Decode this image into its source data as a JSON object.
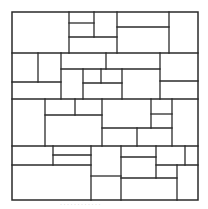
{
  "diagram": {
    "stroke_color": "#2a2a2a",
    "background": "#ffffff",
    "outer": {
      "x": 12,
      "y": 12,
      "width": 186,
      "height": 188
    },
    "bands": [
      {
        "name": "band-1",
        "y_top": 12,
        "y_bottom": 53
      },
      {
        "name": "band-2",
        "y_top": 53,
        "y_bottom": 99
      },
      {
        "name": "band-3",
        "y_top": 99,
        "y_bottom": 146
      },
      {
        "name": "band-4",
        "y_top": 146,
        "y_bottom": 200
      }
    ],
    "segments": [
      {
        "id": "h-band1-bottom",
        "x1": 12,
        "y1": 53,
        "x2": 198,
        "y2": 53
      },
      {
        "id": "h-band2-bottom",
        "x1": 12,
        "y1": 99,
        "x2": 198,
        "y2": 99
      },
      {
        "id": "h-band3-bottom",
        "x1": 12,
        "y1": 146,
        "x2": 198,
        "y2": 146
      },
      {
        "id": "b1-v69",
        "x1": 69,
        "y1": 12,
        "x2": 69,
        "y2": 53
      },
      {
        "id": "b1-h23",
        "x1": 69,
        "y1": 23,
        "x2": 94,
        "y2": 23
      },
      {
        "id": "b1-v94",
        "x1": 94,
        "y1": 12,
        "x2": 94,
        "y2": 37
      },
      {
        "id": "b1-h37",
        "x1": 69,
        "y1": 37,
        "x2": 117,
        "y2": 37
      },
      {
        "id": "b1-v117",
        "x1": 117,
        "y1": 12,
        "x2": 117,
        "y2": 53
      },
      {
        "id": "b1-h27",
        "x1": 117,
        "y1": 27,
        "x2": 169,
        "y2": 27
      },
      {
        "id": "b1-v169",
        "x1": 169,
        "y1": 12,
        "x2": 169,
        "y2": 53
      },
      {
        "id": "b2-v38",
        "x1": 38,
        "y1": 53,
        "x2": 38,
        "y2": 82
      },
      {
        "id": "b2-h82",
        "x1": 12,
        "y1": 82,
        "x2": 61,
        "y2": 82
      },
      {
        "id": "b2-v61",
        "x1": 61,
        "y1": 53,
        "x2": 61,
        "y2": 99
      },
      {
        "id": "b2-h69",
        "x1": 61,
        "y1": 69,
        "x2": 160,
        "y2": 69
      },
      {
        "id": "b2-v106",
        "x1": 106,
        "y1": 53,
        "x2": 106,
        "y2": 69
      },
      {
        "id": "b2-v83",
        "x1": 83,
        "y1": 69,
        "x2": 83,
        "y2": 99
      },
      {
        "id": "b2-v101",
        "x1": 101,
        "y1": 69,
        "x2": 101,
        "y2": 83
      },
      {
        "id": "b2-h83",
        "x1": 83,
        "y1": 83,
        "x2": 122,
        "y2": 83
      },
      {
        "id": "b2-v122",
        "x1": 122,
        "y1": 69,
        "x2": 122,
        "y2": 99
      },
      {
        "id": "b2-v160",
        "x1": 160,
        "y1": 53,
        "x2": 160,
        "y2": 99
      },
      {
        "id": "b2-h81",
        "x1": 160,
        "y1": 81,
        "x2": 198,
        "y2": 81
      },
      {
        "id": "b3-v45",
        "x1": 45,
        "y1": 99,
        "x2": 45,
        "y2": 146
      },
      {
        "id": "b3-v75",
        "x1": 75,
        "y1": 99,
        "x2": 75,
        "y2": 115
      },
      {
        "id": "b3-h115",
        "x1": 45,
        "y1": 115,
        "x2": 102,
        "y2": 115
      },
      {
        "id": "b3-v102",
        "x1": 102,
        "y1": 99,
        "x2": 102,
        "y2": 146
      },
      {
        "id": "b3-h128",
        "x1": 102,
        "y1": 128,
        "x2": 172,
        "y2": 128
      },
      {
        "id": "b3-v151",
        "x1": 151,
        "y1": 99,
        "x2": 151,
        "y2": 128
      },
      {
        "id": "b3-h114",
        "x1": 151,
        "y1": 114,
        "x2": 172,
        "y2": 114
      },
      {
        "id": "b3-v137",
        "x1": 137,
        "y1": 128,
        "x2": 137,
        "y2": 146
      },
      {
        "id": "b3-v172",
        "x1": 172,
        "y1": 99,
        "x2": 172,
        "y2": 146
      },
      {
        "id": "b4-v53",
        "x1": 53,
        "y1": 146,
        "x2": 53,
        "y2": 165
      },
      {
        "id": "b4-h155",
        "x1": 53,
        "y1": 155,
        "x2": 91,
        "y2": 155
      },
      {
        "id": "b4-h165",
        "x1": 12,
        "y1": 165,
        "x2": 91,
        "y2": 165
      },
      {
        "id": "b4-v91",
        "x1": 91,
        "y1": 146,
        "x2": 91,
        "y2": 200
      },
      {
        "id": "b4-h176",
        "x1": 91,
        "y1": 176,
        "x2": 121,
        "y2": 176
      },
      {
        "id": "b4-v121",
        "x1": 121,
        "y1": 146,
        "x2": 121,
        "y2": 200
      },
      {
        "id": "b4-h157",
        "x1": 121,
        "y1": 157,
        "x2": 156,
        "y2": 157
      },
      {
        "id": "b4-v156",
        "x1": 156,
        "y1": 146,
        "x2": 156,
        "y2": 178
      },
      {
        "id": "b4-h178",
        "x1": 121,
        "y1": 178,
        "x2": 177,
        "y2": 178
      },
      {
        "id": "b4-v185",
        "x1": 185,
        "y1": 146,
        "x2": 185,
        "y2": 165
      },
      {
        "id": "b4-h165r",
        "x1": 156,
        "y1": 165,
        "x2": 198,
        "y2": 165
      },
      {
        "id": "b4-v177",
        "x1": 177,
        "y1": 165,
        "x2": 177,
        "y2": 200
      }
    ]
  },
  "caption": {
    "text": "· · · · · · · ·  ·  · · ·"
  }
}
